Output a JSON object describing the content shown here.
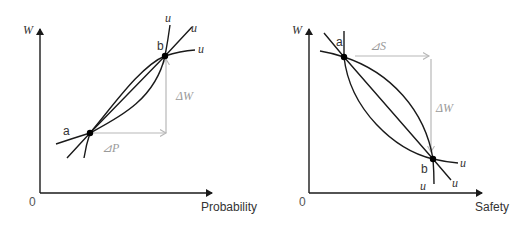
{
  "colors": {
    "curve": "#1a1a1a",
    "guide": "#b8b8b8",
    "delta_label": "#9a9a9a"
  },
  "left_diagram": {
    "y_axis_label": "W",
    "x_axis_label": "Probability",
    "origin_label": "0",
    "point_a_label": "a",
    "point_b_label": "b",
    "curve_labels": [
      "u",
      "u",
      "u"
    ],
    "delta_x_label": "⊿P",
    "delta_y_label": "ΔW"
  },
  "right_diagram": {
    "y_axis_label": "W",
    "x_axis_label": "Safety",
    "origin_label": "0",
    "point_a_label": "a",
    "point_b_label": "b",
    "curve_labels": [
      "u",
      "u",
      "u"
    ],
    "delta_x_label": "⊿S",
    "delta_y_label": "ΔW"
  }
}
